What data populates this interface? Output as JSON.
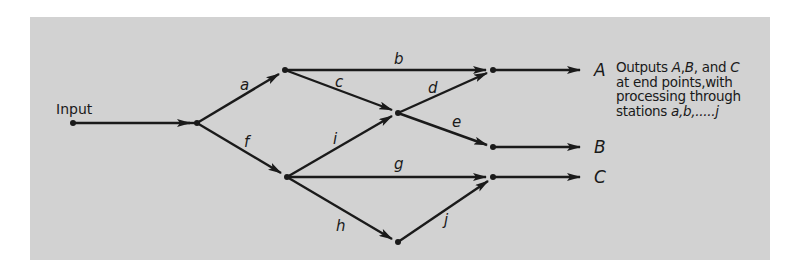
{
  "diagram": {
    "input_label": "Input",
    "edges": [
      {
        "id": "input",
        "label": ""
      },
      {
        "id": "a",
        "label": "a"
      },
      {
        "id": "b",
        "label": "b"
      },
      {
        "id": "c",
        "label": "c"
      },
      {
        "id": "d",
        "label": "d"
      },
      {
        "id": "e",
        "label": "e"
      },
      {
        "id": "f",
        "label": "f"
      },
      {
        "id": "g",
        "label": "g"
      },
      {
        "id": "h",
        "label": "h"
      },
      {
        "id": "i",
        "label": "i"
      },
      {
        "id": "j",
        "label": "j"
      }
    ],
    "outputs": {
      "A": "A",
      "B": "B",
      "C": "C"
    },
    "note": {
      "line1_prefix": "Outputs ",
      "line1_A": "A",
      "line1_sep1": ",",
      "line1_B": "B",
      "line1_sep2": ", and",
      "line1_C": "C",
      "line2": "at end points,with",
      "line3": "processing through",
      "line4_prefix": "stations ",
      "line4_stations": "a,b,.....j"
    },
    "colors": {
      "background": "#d2d2d2",
      "ink": "#1a1a1a"
    }
  }
}
